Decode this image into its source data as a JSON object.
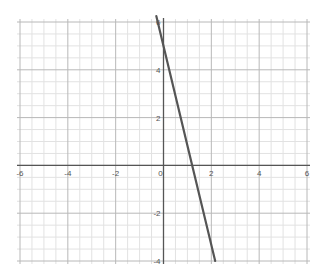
{
  "chart_data": {
    "type": "line",
    "title": "",
    "xlabel": "",
    "ylabel": "",
    "xlim": [
      -6,
      6
    ],
    "ylim": [
      -4,
      6
    ],
    "grid": true,
    "minor_grid_step": 0.5,
    "major_grid_step": 2,
    "x_ticks": [
      -6,
      -4,
      -2,
      0,
      2,
      4,
      6
    ],
    "y_ticks": [
      -4,
      -2,
      2,
      4,
      6
    ],
    "x_tick_labels": [
      "-6",
      "-4",
      "-2",
      "0",
      "2",
      "4",
      "6"
    ],
    "y_tick_labels": [
      "-4",
      "-2",
      "2",
      "4",
      "6"
    ],
    "series": [
      {
        "name": "line",
        "color": "#555555",
        "x": [
          -0.3,
          0,
          1.2,
          2.16
        ],
        "y": [
          6.25,
          5,
          0,
          -4
        ]
      }
    ],
    "annotations": []
  },
  "colors": {
    "axis": "#555555",
    "major_grid": "#b8b8b8",
    "minor_grid": "#e2e2e2",
    "line": "#555555",
    "background": "#ffffff"
  }
}
